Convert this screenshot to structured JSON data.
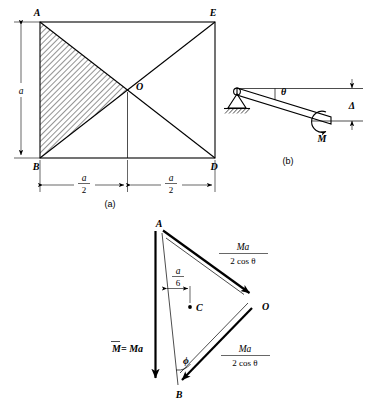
{
  "figure": {
    "caption_a": "(a)",
    "caption_b": "(b)"
  },
  "panel_a": {
    "name": "square-plate-diagram",
    "points": {
      "A": "A",
      "E": "E",
      "B": "B",
      "D": "D",
      "O": "O"
    },
    "dim_height": "a",
    "dim_left_num": "a",
    "dim_left_den": "2",
    "dim_right_num": "a",
    "dim_right_den": "2"
  },
  "panel_b": {
    "name": "pinned-beam-diagram",
    "angle_label": "θ",
    "moment_label": "M",
    "deflection_label": "Δ"
  },
  "panel_c": {
    "name": "force-triangle-diagram",
    "points": {
      "A": "A",
      "O": "O",
      "B": "B",
      "C": "C"
    },
    "dim_num": "a",
    "dim_den": "6",
    "angle_label": "ϕ",
    "moment_label": "M = Ma",
    "moment_overline": "M",
    "moment_rest": " = Ma",
    "force_upper_num": "Ma",
    "force_upper_den": "2 cos θ",
    "force_lower_num": "Ma",
    "force_lower_den": "2 cos θ"
  },
  "colors": {
    "ink": "#000000",
    "paper": "#ffffff",
    "hatch": "#000000"
  }
}
